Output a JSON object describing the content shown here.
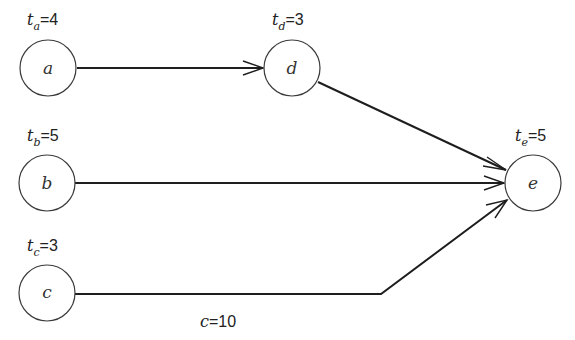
{
  "diagram": {
    "type": "directed-graph",
    "nodes": [
      {
        "id": "a",
        "label": "a",
        "t_var": "t",
        "t_sub": "a",
        "t_eq": "=4",
        "time": 4
      },
      {
        "id": "b",
        "label": "b",
        "t_var": "t",
        "t_sub": "b",
        "t_eq": "=5",
        "time": 5
      },
      {
        "id": "c",
        "label": "c",
        "t_var": "t",
        "t_sub": "c",
        "t_eq": "=3",
        "time": 3
      },
      {
        "id": "d",
        "label": "d",
        "t_var": "t",
        "t_sub": "d",
        "t_eq": "=3",
        "time": 3
      },
      {
        "id": "e",
        "label": "e",
        "t_var": "t",
        "t_sub": "e",
        "t_eq": "=5",
        "time": 5
      }
    ],
    "edges": [
      {
        "from": "a",
        "to": "d"
      },
      {
        "from": "d",
        "to": "e"
      },
      {
        "from": "b",
        "to": "e"
      },
      {
        "from": "c",
        "to": "e"
      }
    ],
    "edge_annotation": {
      "var": "c",
      "eq": "=10",
      "value": 10
    },
    "colors": {
      "stroke": "#1e1e1e",
      "background": "#ffffff"
    }
  }
}
